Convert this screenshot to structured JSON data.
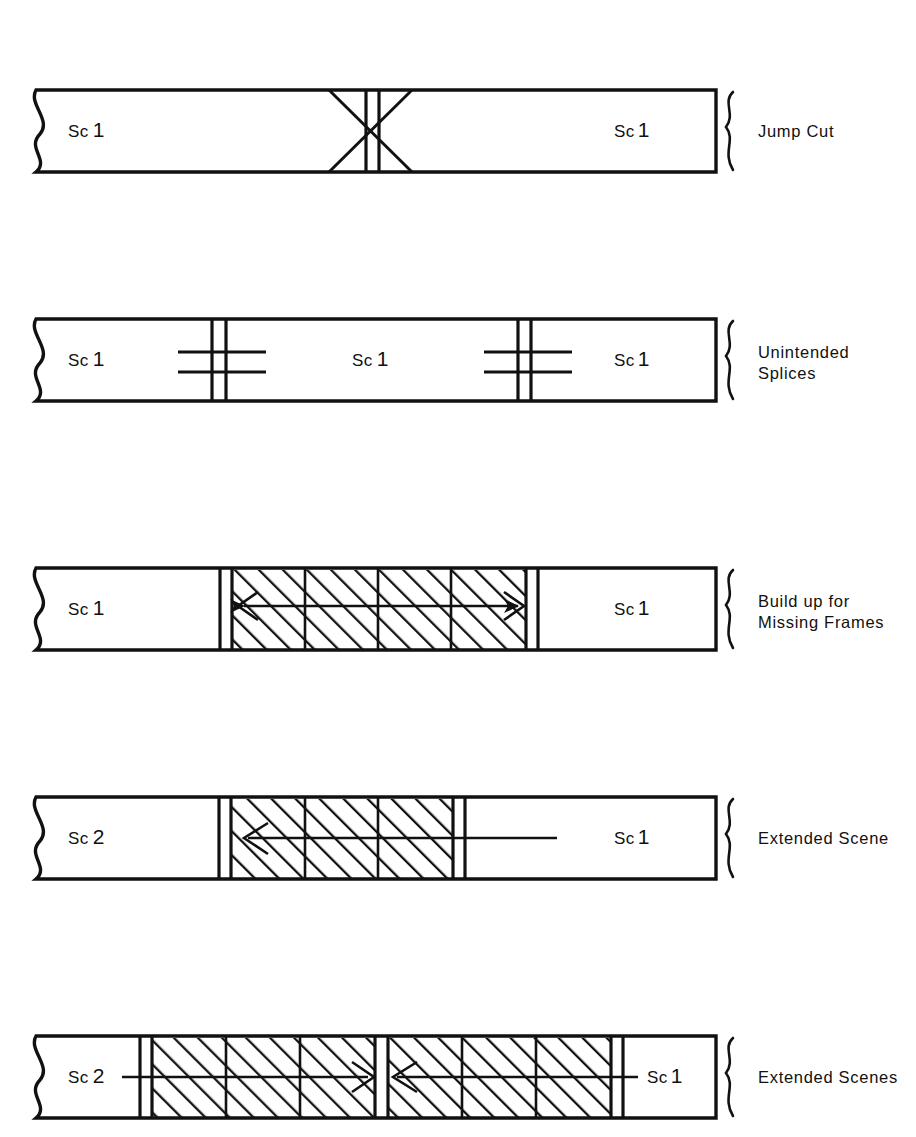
{
  "figure": {
    "background_color": "#ffffff",
    "ink_color": "#111111",
    "rows": [
      {
        "id": "jump-cut",
        "annotation": "Jump Cut",
        "annotation_lines": [
          "Jump Cut"
        ],
        "left_scene": "Sc",
        "left_scene_number": "1",
        "right_scene": "Sc",
        "right_scene_number": "1",
        "marker_type": "x-cross",
        "hatched_frames": 0,
        "arrows": []
      },
      {
        "id": "unintended-splices",
        "annotation": "Unintended Splices",
        "annotation_lines": [
          "Unintended",
          "Splices"
        ],
        "left_scene": "Sc",
        "left_scene_number": "1",
        "middle_scene": "Sc",
        "middle_scene_number": "1",
        "right_scene": "Sc",
        "right_scene_number": "1",
        "marker_type": "tape-splice",
        "splice_count": 2,
        "hatched_frames": 0,
        "arrows": []
      },
      {
        "id": "build-up-for-missing-frames",
        "annotation": "Build up for Missing Frames",
        "annotation_lines": [
          "Build up for",
          "Missing Frames"
        ],
        "left_scene": "Sc",
        "left_scene_number": "1",
        "right_scene": "Sc",
        "right_scene_number": "1",
        "marker_type": "hatched-buildup",
        "hatched_frames": 4,
        "arrows": [
          "double-headed"
        ]
      },
      {
        "id": "extended-scene",
        "annotation": "Extended Scene",
        "annotation_lines": [
          "Extended Scene"
        ],
        "left_scene": "Sc",
        "left_scene_number": "2",
        "right_scene": "Sc",
        "right_scene_number": "1",
        "marker_type": "hatched-buildup",
        "hatched_frames": 3,
        "arrows": [
          "left"
        ]
      },
      {
        "id": "extended-scenes",
        "annotation": "Extended Scenes",
        "annotation_lines": [
          "Extended Scenes"
        ],
        "left_scene": "Sc",
        "left_scene_number": "2",
        "right_scene": "Sc",
        "right_scene_number": "1",
        "marker_type": "hatched-buildup-double",
        "hatched_frames": 7,
        "arrows": [
          "right",
          "left"
        ]
      }
    ]
  }
}
